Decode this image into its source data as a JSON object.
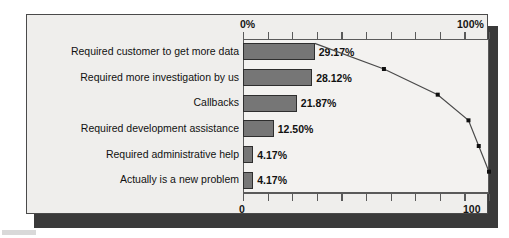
{
  "chart_data": {
    "type": "bar",
    "title": "",
    "subtitle": "",
    "xlabel": "",
    "ylabel": "",
    "categories": [
      "Required customer to get more data",
      "Required more investigation by us",
      "Callbacks",
      "Required development assistance",
      "Required administrative help",
      "Actually is a new problem"
    ],
    "values": [
      29.17,
      28.12,
      21.87,
      12.5,
      4.17,
      4.17
    ],
    "value_labels": [
      "29.17%",
      "28.12%",
      "21.87%",
      "12.50%",
      "4.17%",
      "4.17%"
    ],
    "series": [
      {
        "name": "Percent of occurrences",
        "type": "bar",
        "values": [
          29.17,
          28.12,
          21.87,
          12.5,
          4.17,
          4.17
        ]
      },
      {
        "name": "Cumulative percent",
        "type": "line",
        "values": [
          29.17,
          57.29,
          79.16,
          91.66,
          95.83,
          100.0
        ]
      }
    ],
    "xlim": [
      0,
      100
    ],
    "ylim": [
      0,
      100
    ],
    "grid": false,
    "legend": "none",
    "axes": {
      "top": {
        "label_left": "0%",
        "label_right": "100%",
        "ticks": [
          0,
          10,
          20,
          30,
          40,
          50,
          60,
          70,
          80,
          90,
          100
        ],
        "tick_count": 11
      },
      "bottom": {
        "label_left": "0",
        "label_right": "100",
        "ticks": [
          0,
          10,
          20,
          30,
          40,
          50,
          60,
          70,
          80,
          90,
          100
        ],
        "tick_count": 11
      }
    },
    "colors": {
      "bar_fill": "#767676",
      "bar_outline": "#2e2e2e",
      "line": "#4a4a4a",
      "marker": "#101010",
      "panel_background": "#efeeec",
      "plot_background": "#f3f2f0",
      "panel_border": "#4a4a4a",
      "shadow": "#3a3a3a",
      "text": "#111111"
    }
  }
}
